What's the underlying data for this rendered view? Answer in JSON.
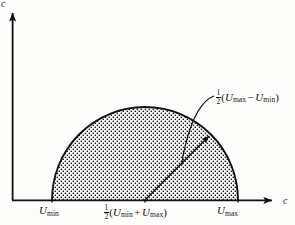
{
  "figure": {
    "type": "semicircle-region-diagram",
    "axes": {
      "y_axis_label": "c",
      "x_axis_label": "c",
      "origin": {
        "x": 12,
        "y": 200
      }
    },
    "ticks": [
      {
        "name": "u-min",
        "label_plain": "U_min",
        "symbol": "U",
        "subscript": "min",
        "x": 52
      },
      {
        "name": "u-mid",
        "label_plain": "1/2(U_min + U_max)",
        "symbol": "U",
        "x": 145
      },
      {
        "name": "u-max",
        "label_plain": "U_max",
        "symbol": "U",
        "subscript": "max",
        "x": 238
      }
    ],
    "tick_labels": {
      "umin_symbol": "U",
      "umin_sub": "min",
      "umid_open": "(",
      "umid_first_symbol": "U",
      "umid_first_sub": "min",
      "umid_operator": "+",
      "umid_second_symbol": "U",
      "umid_second_sub": "max",
      "umid_close": ")",
      "umax_symbol": "U",
      "umax_sub": "max"
    },
    "fraction": {
      "numerator": "1",
      "denominator": "2"
    },
    "annotation": {
      "name": "radius-annotation",
      "text_plain": "1/2(U_max - U_min)",
      "open": "(",
      "first_symbol": "U",
      "first_sub": "max",
      "operator": "−",
      "second_symbol": "U",
      "second_sub": "min",
      "close": ")"
    },
    "region": {
      "name": "stippled-semicircle",
      "center_x": 145,
      "baseline_y": 200,
      "radius": 93,
      "fill_pattern": "dot-stipple",
      "outline_color": "#111111",
      "fill_color": "#ffffff",
      "dot_color": "#1a1a1a"
    },
    "radius_arrow": {
      "name": "radius-arrow",
      "from_x": 145,
      "from_y": 200,
      "to_x": 211,
      "to_y": 134
    },
    "leader_line": {
      "name": "annotation-leader",
      "from_x": 213,
      "from_y": 97,
      "to_x": 183,
      "to_y": 160
    },
    "colors": {
      "ink": "#141414",
      "paper": "#fdfdfb"
    }
  }
}
